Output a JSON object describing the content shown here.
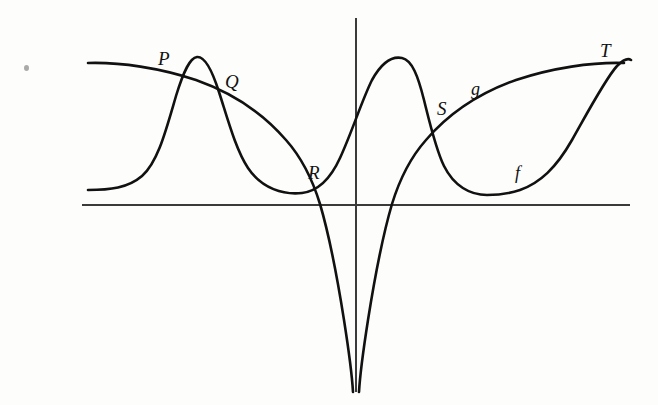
{
  "figure": {
    "type": "math-graph",
    "background_color": "#fdfdfc",
    "ink_color": "#111111",
    "axis_color": "#3b3b3b"
  },
  "axes": {
    "x_axis": {
      "name": "x-axis",
      "x1": 82,
      "y1": 205,
      "x2": 630,
      "y2": 205,
      "stroke_width": 2
    },
    "y_axis": {
      "name": "y-axis",
      "x1": 356,
      "y1": 18,
      "x2": 356,
      "y2": 392,
      "stroke_width": 2
    }
  },
  "curves": [
    {
      "id": "curve-f",
      "label": "f",
      "stroke_width": 2.6,
      "path": "M 88 190 C 110 190 128 188 142 176 C 158 162 166 130 176 96 C 184 70 190 58 197 57 C 205 56 212 70 219 92 C 228 120 236 150 248 168 C 262 189 284 195 302 193 C 318 191 330 180 340 158 C 352 132 362 100 372 80 C 382 62 392 56 402 58 C 412 60 418 76 424 100 C 430 124 436 150 444 166 C 454 186 470 195 487 195 C 496 195 508 194 520 190 C 540 183 556 168 572 140 C 590 108 606 78 617 66 C 623 60 628 58 631 60"
    },
    {
      "id": "curve-g",
      "label": "g",
      "stroke_width": 2.6,
      "path": "M 88 63 C 120 62 160 68 196 80 C 230 92 262 112 286 140 C 302 158 312 178 320 204 C 330 238 338 282 344 320 C 349 352 352 374 353 392 M 359 392 C 360 374 363 352 368 320 C 374 282 382 238 392 204 C 400 178 410 158 426 140 C 450 112 482 92 516 80 C 552 68 592 62 624 63"
    }
  ],
  "labels": [
    {
      "id": "label-P",
      "text": "P",
      "x": 158,
      "y": 49,
      "style": "lbl-upper"
    },
    {
      "id": "label-Q",
      "text": "Q",
      "x": 225,
      "y": 72,
      "style": "lbl-upper"
    },
    {
      "id": "label-R",
      "text": "R",
      "x": 308,
      "y": 163,
      "style": "lbl-upper"
    },
    {
      "id": "label-S",
      "text": "S",
      "x": 437,
      "y": 99,
      "style": "lbl-upper"
    },
    {
      "id": "label-T",
      "text": "T",
      "x": 600,
      "y": 41,
      "style": "lbl-upper"
    },
    {
      "id": "label-g",
      "text": "g",
      "x": 471,
      "y": 80,
      "style": "lbl-curve"
    },
    {
      "id": "label-f",
      "text": "f",
      "x": 515,
      "y": 164,
      "style": "lbl-curve"
    }
  ],
  "artifacts": [
    {
      "id": "scan-speck",
      "x": 24,
      "y": 65
    }
  ]
}
